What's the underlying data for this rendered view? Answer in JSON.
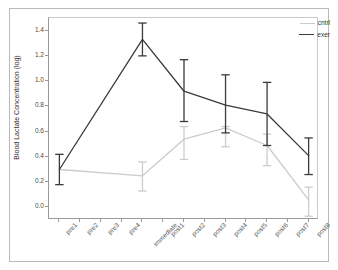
{
  "chart_data": {
    "type": "line",
    "title": "",
    "xlabel": "",
    "ylabel": "Blood Lactate Concentration (log)",
    "ylim": [
      -0.1,
      1.5
    ],
    "yticks": [
      0.0,
      0.2,
      0.4,
      0.6,
      0.8,
      1.0,
      1.2,
      1.4
    ],
    "ytick_labels": [
      "0.0",
      "0.2",
      "0.4",
      "0.6",
      "0.8",
      "1.0",
      "1.2",
      "1.4"
    ],
    "grid": false,
    "legend_position": "top-right",
    "categories": [
      "pre1",
      "pre2",
      "pre3",
      "pre4",
      "immediate",
      "post1",
      "post2",
      "post3",
      "post4",
      "post5",
      "post6",
      "post7",
      "post8"
    ],
    "series": [
      {
        "name": "cntrl",
        "color": "#cccccc",
        "points": [
          {
            "x": "pre1",
            "y": 0.3,
            "err_low": null,
            "err_high": null
          },
          {
            "x": "immediate",
            "y": 0.25,
            "err_low": 0.13,
            "err_high": 0.36
          },
          {
            "x": "post2",
            "y": 0.54,
            "err_low": 0.38,
            "err_high": 0.64
          },
          {
            "x": "post4",
            "y": 0.63,
            "err_low": 0.48,
            "err_high": 0.64
          },
          {
            "x": "post6",
            "y": 0.49,
            "err_low": 0.33,
            "err_high": 0.58
          },
          {
            "x": "post8",
            "y": 0.06,
            "err_low": -0.07,
            "err_high": 0.16
          }
        ]
      },
      {
        "name": "exer",
        "color": "#3a3a3a",
        "points": [
          {
            "x": "pre1",
            "y": 0.3,
            "err_low": 0.18,
            "err_high": 0.42
          },
          {
            "x": "immediate",
            "y": 1.33,
            "err_low": 1.2,
            "err_high": 1.46
          },
          {
            "x": "post2",
            "y": 0.92,
            "err_low": 0.68,
            "err_high": 1.17
          },
          {
            "x": "post4",
            "y": 0.81,
            "err_low": 0.59,
            "err_high": 1.05
          },
          {
            "x": "post6",
            "y": 0.74,
            "err_low": 0.49,
            "err_high": 0.99
          },
          {
            "x": "post8",
            "y": 0.41,
            "err_low": 0.26,
            "err_high": 0.55
          }
        ]
      }
    ]
  }
}
